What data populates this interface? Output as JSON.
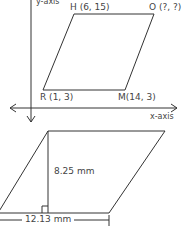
{
  "top_figure": {
    "y_axis_label": "y-axis",
    "x_axis_label": "x-axis",
    "vertices": {
      "H": "H (6, 15)",
      "O": "O (?, ?)",
      "R": "R (1, 3)",
      "M": "M(14, 3)"
    }
  },
  "bottom_figure": {
    "height_label": "8.25 mm",
    "base_label": "12.13 mm"
  },
  "colors": {
    "line": "#333333",
    "text": "#444444"
  }
}
